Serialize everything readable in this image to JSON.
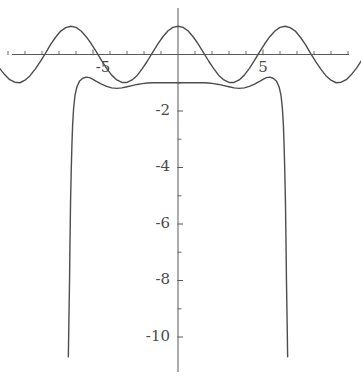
{
  "figure": {
    "title": "",
    "background_color": "#ffffff",
    "width": 361,
    "height": 382
  },
  "axes": {
    "axis_color": "#5a5a5a",
    "origin_px": {
      "x": 178,
      "y": 54.5
    },
    "x_unit_px": 17.0,
    "y_unit_px": 28.25,
    "x_axis": {
      "label": "",
      "range": [
        -10.5,
        10.8
      ],
      "major_ticks": [
        -5,
        5
      ],
      "major_tick_labels": [
        "-5",
        "5"
      ],
      "minor_tick_step": 1,
      "minor_ticks": [
        -10,
        -9,
        -8,
        -7,
        -6,
        -5,
        -4,
        -3,
        -2,
        -1,
        1,
        2,
        3,
        4,
        5,
        6,
        7,
        8,
        9,
        10
      ],
      "grid": false
    },
    "y_axis": {
      "label": "",
      "range": [
        -10.8,
        1.3
      ],
      "major_ticks": [
        -2,
        -4,
        -6,
        -8,
        -10
      ],
      "major_tick_labels": [
        "-2",
        "-4",
        "-6",
        "-8",
        "-10"
      ],
      "minor_tick_step": 1,
      "minor_ticks": [
        -1,
        -2,
        -3,
        -4,
        -5,
        -6,
        -7,
        -8,
        -9,
        -10
      ],
      "grid": false
    }
  },
  "chart_data": {
    "type": "line",
    "title": "",
    "xlabel": "",
    "ylabel": "",
    "xlim": [
      -10.5,
      10.8
    ],
    "ylim": [
      -10.8,
      1.3
    ],
    "grid": false,
    "legend": "none",
    "series": [
      {
        "name": "cosine-wave",
        "color": "#4d4d4d",
        "line_width": 1.4,
        "description": "cos(x), amplitude 1, period 2*pi, maxima at x = -6.28, 0, 6.28, minima at x = -3.14, 3.14, 9.42",
        "x": [
          -10.5,
          -10.2,
          -9.9,
          -9.6,
          -9.3,
          -9.0,
          -8.7,
          -8.4,
          -8.1,
          -7.8,
          -7.5,
          -7.2,
          -6.9,
          -6.6,
          -6.3,
          -6.0,
          -5.7,
          -5.4,
          -5.1,
          -4.8,
          -4.5,
          -4.2,
          -3.9,
          -3.6,
          -3.3,
          -3.0,
          -2.7,
          -2.4,
          -2.1,
          -1.8,
          -1.5,
          -1.2,
          -0.9,
          -0.6,
          -0.3,
          0.0,
          0.3,
          0.6,
          0.9,
          1.2,
          1.5,
          1.8,
          2.1,
          2.4,
          2.7,
          3.0,
          3.3,
          3.6,
          3.9,
          4.2,
          4.5,
          4.8,
          5.1,
          5.4,
          5.7,
          6.0,
          6.3,
          6.6,
          6.9,
          7.2,
          7.5,
          7.8,
          8.1,
          8.4,
          8.7,
          9.0,
          9.3,
          9.6,
          9.9,
          10.2,
          10.5,
          10.8
        ],
        "y": [
          -0.48,
          -0.71,
          -0.89,
          -0.98,
          -1.0,
          -0.91,
          -0.75,
          -0.52,
          -0.25,
          0.04,
          0.35,
          0.61,
          0.83,
          0.95,
          1.0,
          0.96,
          0.83,
          0.63,
          0.38,
          0.09,
          -0.21,
          -0.49,
          -0.73,
          -0.9,
          -0.99,
          -0.99,
          -0.9,
          -0.74,
          -0.5,
          -0.23,
          0.07,
          0.36,
          0.62,
          0.83,
          0.96,
          1.0,
          0.96,
          0.83,
          0.62,
          0.36,
          0.07,
          -0.23,
          -0.5,
          -0.74,
          -0.9,
          -0.99,
          -0.99,
          -0.9,
          -0.73,
          -0.49,
          -0.21,
          0.09,
          0.38,
          0.63,
          0.83,
          0.96,
          1.0,
          0.95,
          0.83,
          0.61,
          0.35,
          0.04,
          -0.25,
          -0.52,
          -0.75,
          -0.91,
          -1.0,
          -0.98,
          -0.89,
          -0.71,
          -0.48,
          -0.21
        ]
      },
      {
        "name": "descending-branch-curve",
        "color": "#4d4d4d",
        "line_width": 1.4,
        "description": "Second curve: flat near y = -1 for |x| < 5 region with shallow trough, rising to local maxima near x = -5 and x = 5 at about y = -0.8, then plunging almost vertically to below y = -11 at x = -6.2 and x = 6.2",
        "x": [
          -6.45,
          -6.42,
          -6.38,
          -6.35,
          -6.32,
          -6.28,
          -6.24,
          -6.2,
          -6.14,
          -6.06,
          -5.95,
          -5.8,
          -5.6,
          -5.4,
          -5.2,
          -5.0,
          -4.8,
          -4.5,
          -4.2,
          -3.9,
          -3.6,
          -3.3,
          -3.0,
          -2.7,
          -2.4,
          -2.1,
          -1.8,
          -1.5,
          -1.2,
          -0.9,
          -0.6,
          -0.3,
          0.0
        ],
        "y": [
          -10.7,
          -9.5,
          -8.0,
          -6.5,
          -5.2,
          -4.1,
          -3.2,
          -2.5,
          -1.9,
          -1.45,
          -1.15,
          -0.95,
          -0.84,
          -0.8,
          -0.82,
          -0.88,
          -0.95,
          -1.05,
          -1.13,
          -1.18,
          -1.2,
          -1.18,
          -1.14,
          -1.1,
          -1.06,
          -1.03,
          -1.01,
          -1.0,
          -1.0,
          -1.0,
          -1.0,
          -1.0,
          -1.0
        ],
        "mirrored": true
      }
    ],
    "annotations": []
  },
  "labels": {
    "x_minus5": "-5",
    "x_plus5": "5",
    "y_minus2": "-2",
    "y_minus4": "-4",
    "y_minus6": "-6",
    "y_minus8": "-8",
    "y_minus10": "-10"
  }
}
